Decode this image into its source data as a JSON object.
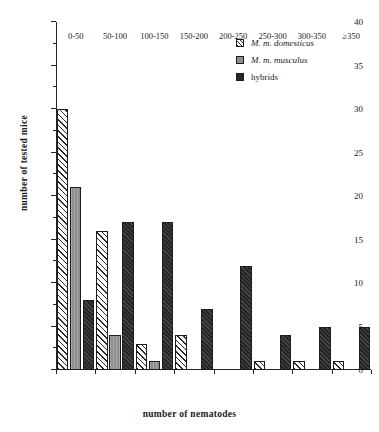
{
  "chart_data": {
    "type": "bar",
    "title": "",
    "xlabel": "number of nematodes",
    "ylabel": "number of tested mice",
    "categories": [
      "0-50",
      "50-100",
      "100-150",
      "150-200",
      "200-250",
      "250-300",
      "300-350",
      "≥350"
    ],
    "series": [
      {
        "name": "M. m. domesticus",
        "values": [
          30,
          16,
          3,
          4,
          0,
          1,
          1,
          1
        ],
        "fill": "diagonal-hatch",
        "color": "#ffffff",
        "italic": true
      },
      {
        "name": "M. m. musculus",
        "values": [
          21,
          4,
          1,
          0,
          0,
          0,
          0,
          0
        ],
        "fill": "solid-gray",
        "color": "#8f8f8f",
        "italic": true
      },
      {
        "name": "hybrids",
        "values": [
          8,
          17,
          17,
          7,
          12,
          4,
          5,
          5
        ],
        "fill": "solid-dark",
        "color": "#262626",
        "italic": false
      }
    ],
    "ylim": [
      0,
      40
    ],
    "yticks_major": [
      0,
      5,
      10,
      15,
      20,
      25,
      30,
      35,
      40
    ],
    "yticks_minor": [
      2.5,
      7.5,
      12.5,
      17.5,
      22.5,
      27.5,
      32.5,
      37.5
    ],
    "ytick_labels": [
      "0",
      "5",
      "10",
      "15",
      "20",
      "25",
      "30",
      "35",
      "40"
    ],
    "grid": false,
    "legend_position": "top-right"
  }
}
